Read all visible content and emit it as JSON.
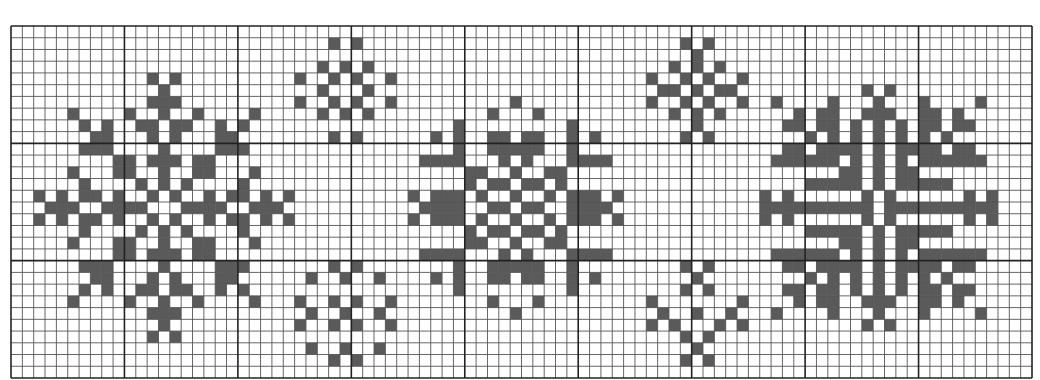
{
  "chart": {
    "title": "",
    "type": "cross-stitch-pattern",
    "cols": 90,
    "rows": 30,
    "major_every": 10,
    "colors": {
      "background": "#ffffff",
      "cell_fill": "#5a5a5a",
      "minor_line": "#555555",
      "major_line": "#222222"
    }
  },
  "motifs": [
    {
      "name": "large-snowflake-left",
      "mirror_row": 15,
      "rows": {
        "4": [
          12,
          14
        ],
        "5": [
          13
        ],
        "6": [
          12,
          13,
          14
        ],
        "7": [
          5,
          10,
          13,
          16,
          21
        ],
        "8": [
          6,
          8,
          11,
          12,
          14,
          15,
          18,
          20
        ],
        "9": [
          7,
          8,
          12,
          14,
          18,
          19
        ],
        "10": [
          6,
          7,
          8,
          13,
          18,
          19,
          20
        ],
        "11": [
          9,
          10,
          12,
          13,
          14,
          16,
          17
        ],
        "12": [
          5,
          9,
          10,
          13,
          16,
          17,
          21
        ],
        "13": [
          6,
          11,
          13,
          15,
          20
        ],
        "14": [
          2,
          4,
          6,
          7,
          9,
          12,
          14,
          17,
          19,
          20,
          22,
          24
        ],
        "15": [
          3,
          4,
          5,
          8,
          9,
          10,
          11,
          15,
          16,
          17,
          18,
          21,
          22,
          23
        ]
      }
    },
    {
      "name": "small-snowflake-top-left",
      "rows": {
        "1": [
          28,
          30
        ],
        "3": [
          27,
          29,
          31
        ],
        "4": [
          25,
          28,
          30,
          33
        ],
        "5": [
          27,
          31
        ],
        "6": [
          25,
          28,
          30,
          33
        ],
        "7": [
          27,
          29,
          31
        ],
        "9": [
          28,
          30
        ]
      }
    },
    {
      "name": "small-snowflake-bottom-left",
      "rows": {
        "20": [
          28,
          30
        ],
        "21": [
          26,
          29,
          32
        ],
        "23": [
          25,
          28,
          30,
          33
        ],
        "24": [
          26,
          29,
          32
        ],
        "25": [
          25,
          28,
          30,
          33
        ],
        "27": [
          26,
          29,
          32
        ],
        "28": [
          28,
          30
        ]
      }
    },
    {
      "name": "large-snowflake-center",
      "mirror_row": 15,
      "rows": {
        "6": [
          44
        ],
        "7": [
          42,
          46
        ],
        "8": [
          39,
          49
        ],
        "9": [
          37,
          39,
          42,
          43,
          45,
          46,
          49,
          51
        ],
        "10": [
          39,
          42,
          43,
          44,
          45,
          46,
          49
        ],
        "11": [
          36,
          37,
          38,
          39,
          43,
          45,
          49,
          50,
          51,
          52
        ],
        "12": [
          40,
          41,
          44,
          47,
          48
        ],
        "13": [
          40,
          42,
          43,
          45,
          46,
          48
        ],
        "14": [
          35,
          37,
          38,
          39,
          41,
          44,
          47,
          49,
          50,
          51,
          53
        ],
        "15": [
          36,
          37,
          38,
          39,
          42,
          43,
          45,
          46,
          49,
          50,
          51,
          52
        ]
      }
    },
    {
      "name": "small-snowflake-top-right",
      "rows": {
        "1": [
          59,
          61
        ],
        "2": [
          60
        ],
        "3": [
          58,
          60,
          62
        ],
        "4": [
          56,
          59,
          61,
          64
        ],
        "5": [
          57,
          58,
          60,
          62,
          63
        ],
        "6": [
          56,
          59,
          61,
          64
        ],
        "7": [
          58,
          60,
          62
        ],
        "8": [
          60
        ],
        "9": [
          59,
          61
        ]
      }
    },
    {
      "name": "small-snowflake-bottom-right",
      "rows": {
        "20": [
          59,
          61
        ],
        "21": [
          60
        ],
        "22": [
          59,
          61
        ],
        "23": [
          56,
          64
        ],
        "24": [
          57,
          60,
          63
        ],
        "25": [
          56,
          58,
          62,
          64
        ],
        "26": [
          59,
          61
        ],
        "27": [
          60
        ],
        "28": [
          59,
          61
        ]
      }
    },
    {
      "name": "large-snowflake-right",
      "mirror_row": 15,
      "rows": {
        "5": [
          75,
          77
        ],
        "6": [
          67,
          72,
          76,
          80,
          85
        ],
        "7": [
          69,
          71,
          72,
          75,
          76,
          77,
          80,
          81,
          83
        ],
        "8": [
          68,
          69,
          71,
          72,
          74,
          76,
          78,
          80,
          81,
          83,
          84
        ],
        "9": [
          70,
          72,
          74,
          76,
          78,
          80,
          82
        ],
        "10": [
          68,
          69,
          71,
          72,
          73,
          74,
          76,
          78,
          79,
          80,
          81,
          83,
          84
        ],
        "11": [
          67,
          68,
          69,
          70,
          71,
          72,
          74,
          76,
          78,
          80,
          81,
          82,
          83,
          84,
          85
        ],
        "12": [
          73,
          74,
          76,
          78,
          79
        ],
        "13": [
          70,
          71,
          72,
          73,
          74,
          76,
          78,
          79,
          80,
          81,
          82
        ],
        "14": [
          66,
          68,
          75,
          77,
          84,
          86
        ],
        "15": [
          66,
          67,
          68,
          69,
          70,
          71,
          72,
          73,
          74,
          75,
          77,
          78,
          79,
          80,
          81,
          82,
          83,
          84,
          85,
          86
        ]
      }
    }
  ]
}
